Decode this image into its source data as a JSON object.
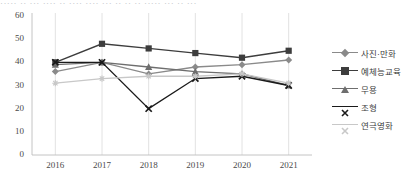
{
  "top_cut_text": "····· ·· ··· ···· ·· ···· ···· ··· ·· ·· ·· ····· ··· ·· ···",
  "chart_data": {
    "type": "line",
    "title": "",
    "xlabel": "",
    "ylabel": "",
    "x": [
      "2016",
      "2017",
      "2018",
      "2019",
      "2020",
      "2021"
    ],
    "categories": [
      "2016",
      "2017",
      "2018",
      "2019",
      "2020",
      "2021"
    ],
    "ylim": [
      0,
      60
    ],
    "yticks": [
      0,
      10,
      20,
      30,
      40,
      50,
      60
    ],
    "grid": true,
    "grid_axis": "x",
    "legend_position": "right",
    "series": [
      {
        "name": "사진·만화",
        "values": [
          36,
          40,
          35,
          38,
          39,
          41
        ],
        "color": "#8a8a8a",
        "marker": "diamond"
      },
      {
        "name": "예체능교육",
        "values": [
          40,
          48,
          46,
          44,
          42,
          45
        ],
        "color": "#3d3d3d",
        "marker": "square"
      },
      {
        "name": "무용",
        "values": [
          39,
          40,
          38,
          36,
          35,
          30
        ],
        "color": "#6e6e6e",
        "marker": "triangle"
      },
      {
        "name": "조형",
        "values": [
          40,
          40,
          20,
          33,
          34,
          30
        ],
        "color": "#1a1a1a",
        "marker": "cross"
      },
      {
        "name": "연극영화",
        "values": [
          31,
          33,
          34,
          34,
          35,
          31
        ],
        "color": "#c8c8c8",
        "marker": "asterisk"
      }
    ]
  }
}
